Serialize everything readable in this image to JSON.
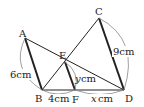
{
  "diagram": {
    "points": {
      "A": {
        "label": "A",
        "x": 25,
        "y": 38
      },
      "B": {
        "label": "B",
        "x": 42,
        "y": 90
      },
      "C": {
        "label": "C",
        "x": 99,
        "y": 18
      },
      "D": {
        "label": "D",
        "x": 124,
        "y": 90
      },
      "E": {
        "label": "E",
        "x": 65,
        "y": 62
      },
      "F": {
        "label": "F",
        "x": 75,
        "y": 90
      }
    },
    "segments": {
      "AB": {
        "thick": true
      },
      "EF": {
        "thick": true
      },
      "CD": {
        "thick": true
      },
      "AD": {
        "thick": false
      },
      "BC": {
        "thick": false
      },
      "BD": {
        "thick": false
      }
    },
    "measures": {
      "AB": "6cm",
      "CD": "9cm",
      "EF_var": "y",
      "EF_unit": "cm",
      "BF": "4cm",
      "FD_var": "x",
      "FD_unit": "cm"
    },
    "colors": {
      "line": "#222222",
      "arc": "#888888"
    }
  }
}
